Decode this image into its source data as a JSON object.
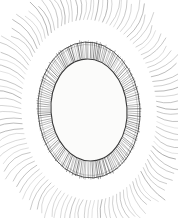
{
  "figure": {
    "title": "Radiolarian / diatom microscopy line illustration",
    "subject_name": "radiate-oval-microorganism",
    "medium": "pen-and-ink stipple line drawing",
    "background_color": "#ffffff",
    "ink_color": "#2b2b2b",
    "ink_color_light": "#6e6e6e",
    "ink_color_faint": "#9a9a9a",
    "canvas": {
      "width": 178,
      "height": 218
    }
  },
  "structure": {
    "center": {
      "cx": 89,
      "cy": 110
    },
    "inner_body": {
      "name": "central-capsule",
      "rx": 38,
      "ry": 51,
      "rotation_deg": -4,
      "fill": "#fbfbfa",
      "stroke": "#3a3a3a",
      "stroke_width": 1.1
    },
    "outer_ring": {
      "name": "perforated-shell-wall",
      "rx": 51,
      "ry": 68,
      "rotation_deg": -4,
      "stroke": "#3a3a3a",
      "stroke_width": 0.9
    },
    "hatch_band": {
      "name": "radial-hatch-band",
      "count": 170,
      "inner_scale": 1.0,
      "outer_scale": 1.34,
      "stroke": "#454545",
      "stroke_width": 0.55
    },
    "spines": {
      "name": "radiating-spines",
      "count": 112,
      "inner_scale": 1.34,
      "length_min": 26,
      "length_max": 40,
      "curve_bow": 7,
      "stroke": "#8a8a8a",
      "stroke_width": 0.6
    },
    "cells": {
      "name": "areolae-cells",
      "count": 88,
      "radius_min": 2.8,
      "radius_max": 4.6,
      "stroke": "#3c3c3c",
      "stroke_width": 0.7,
      "spoke_count_min": 6,
      "spoke_count_max": 10
    }
  },
  "chart_data": {
    "type": "scatter",
    "title": "Radiolarian / diatom microscopy line illustration",
    "xlabel": "",
    "ylabel": "",
    "xlim": [
      0,
      178
    ],
    "ylim": [
      0,
      218
    ],
    "grid": false,
    "legend": false,
    "series": [
      {
        "name": "areolae-cells",
        "marker": "circle-with-spokes",
        "points": [
          [
            72,
            64,
            3.4
          ],
          [
            84,
            62,
            3.0
          ],
          [
            96,
            64,
            3.6
          ],
          [
            106,
            68,
            3.1
          ],
          [
            63,
            70,
            3.2
          ],
          [
            77,
            71,
            4.0
          ],
          [
            90,
            70,
            3.3
          ],
          [
            101,
            73,
            3.8
          ],
          [
            113,
            74,
            3.0
          ],
          [
            58,
            78,
            3.5
          ],
          [
            70,
            79,
            3.1
          ],
          [
            82,
            78,
            3.7
          ],
          [
            94,
            80,
            3.2
          ],
          [
            106,
            81,
            3.9
          ],
          [
            117,
            82,
            2.9
          ],
          [
            55,
            87,
            3.3
          ],
          [
            66,
            86,
            3.8
          ],
          [
            78,
            87,
            3.1
          ],
          [
            89,
            88,
            4.2
          ],
          [
            100,
            87,
            3.4
          ],
          [
            111,
            89,
            3.6
          ],
          [
            120,
            90,
            3.0
          ],
          [
            53,
            96,
            3.6
          ],
          [
            64,
            95,
            3.2
          ],
          [
            75,
            96,
            4.0
          ],
          [
            86,
            95,
            3.3
          ],
          [
            97,
            97,
            3.7
          ],
          [
            108,
            96,
            3.1
          ],
          [
            118,
            98,
            3.5
          ],
          [
            52,
            105,
            3.2
          ],
          [
            62,
            104,
            3.9
          ],
          [
            73,
            105,
            3.4
          ],
          [
            84,
            104,
            3.0
          ],
          [
            95,
            106,
            4.1
          ],
          [
            106,
            105,
            3.3
          ],
          [
            116,
            106,
            3.7
          ],
          [
            124,
            104,
            2.9
          ],
          [
            54,
            114,
            3.5
          ],
          [
            65,
            113,
            3.1
          ],
          [
            76,
            114,
            3.8
          ],
          [
            87,
            113,
            3.4
          ],
          [
            98,
            115,
            3.0
          ],
          [
            109,
            114,
            3.6
          ],
          [
            119,
            115,
            3.2
          ],
          [
            56,
            123,
            3.3
          ],
          [
            67,
            122,
            3.7
          ],
          [
            78,
            123,
            3.1
          ],
          [
            89,
            122,
            3.9
          ],
          [
            100,
            124,
            3.4
          ],
          [
            111,
            123,
            3.0
          ],
          [
            120,
            122,
            3.5
          ],
          [
            58,
            132,
            3.6
          ],
          [
            69,
            131,
            3.2
          ],
          [
            80,
            132,
            4.0
          ],
          [
            91,
            131,
            3.3
          ],
          [
            102,
            133,
            3.7
          ],
          [
            113,
            132,
            3.1
          ],
          [
            61,
            141,
            3.4
          ],
          [
            72,
            140,
            3.8
          ],
          [
            83,
            141,
            3.0
          ],
          [
            94,
            140,
            3.5
          ],
          [
            105,
            142,
            3.9
          ],
          [
            115,
            140,
            3.2
          ],
          [
            65,
            149,
            3.1
          ],
          [
            76,
            150,
            3.6
          ],
          [
            87,
            149,
            3.3
          ],
          [
            98,
            150,
            3.8
          ],
          [
            108,
            148,
            3.0
          ],
          [
            71,
            157,
            3.5
          ],
          [
            82,
            158,
            3.2
          ],
          [
            93,
            157,
            3.7
          ],
          [
            103,
            156,
            3.1
          ],
          [
            79,
            164,
            3.3
          ],
          [
            90,
            164,
            3.6
          ],
          [
            68,
            58,
            2.9
          ],
          [
            91,
            56,
            3.1
          ],
          [
            104,
            59,
            2.8
          ],
          [
            60,
            63,
            2.9
          ],
          [
            110,
            63,
            3.0
          ],
          [
            50,
            112,
            2.8
          ],
          [
            127,
            110,
            2.8
          ],
          [
            124,
            96,
            3.0
          ],
          [
            125,
            118,
            2.9
          ],
          [
            51,
            120,
            3.0
          ],
          [
            63,
            158,
            2.9
          ],
          [
            99,
            165,
            3.0
          ],
          [
            86,
            170,
            2.9
          ]
        ]
      }
    ]
  }
}
